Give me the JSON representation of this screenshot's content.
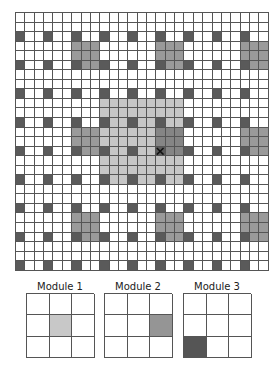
{
  "grid": {
    "rows": 27,
    "cols": 27,
    "cell_width": 9.37,
    "cell_height": 9.55,
    "colors": {
      "empty": "#ffffff",
      "dark": "#5a5a5a",
      "medium": "#9a9a9a",
      "medium_center": "#858585",
      "light": "#c6c6c6",
      "line": "#555555"
    },
    "dark_cells_rule": "row % 3 == 2 and col % 3 == 0",
    "medium_blocks": [
      {
        "rows": [
          3,
          5
        ],
        "cols": [
          6,
          8
        ]
      },
      {
        "rows": [
          3,
          5
        ],
        "cols": [
          15,
          17
        ]
      },
      {
        "rows": [
          3,
          5
        ],
        "cols": [
          24,
          26
        ]
      },
      {
        "rows": [
          12,
          14
        ],
        "cols": [
          6,
          8
        ]
      },
      {
        "rows": [
          12,
          14
        ],
        "cols": [
          15,
          17
        ],
        "shade": "medium_center"
      },
      {
        "rows": [
          12,
          14
        ],
        "cols": [
          24,
          26
        ]
      },
      {
        "rows": [
          21,
          23
        ],
        "cols": [
          6,
          8
        ]
      },
      {
        "rows": [
          21,
          23
        ],
        "cols": [
          15,
          17
        ]
      },
      {
        "rows": [
          21,
          23
        ],
        "cols": [
          24,
          26
        ]
      }
    ],
    "light_region": {
      "rows": [
        9,
        17
      ],
      "cols": [
        9,
        17
      ]
    },
    "marker": {
      "row": 14,
      "col": 15,
      "icon": "x-mark-icon"
    }
  },
  "modules": [
    {
      "label": "Module 1",
      "shaded_cell": {
        "row": 1,
        "col": 1
      },
      "shade": "#c8c8c8"
    },
    {
      "label": "Module 2",
      "shaded_cell": {
        "row": 1,
        "col": 2
      },
      "shade": "#959595"
    },
    {
      "label": "Module 3",
      "shaded_cell": {
        "row": 2,
        "col": 0
      },
      "shade": "#555555"
    }
  ]
}
